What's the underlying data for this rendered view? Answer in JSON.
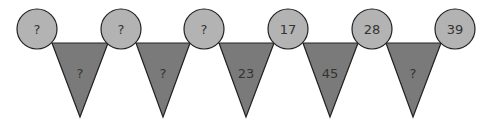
{
  "puzzle": {
    "circle_fill": "#b3b3b3",
    "triangle_fill": "#7a7a7a",
    "stroke": "#222222",
    "circles": [
      {
        "label": "?",
        "cx": 37
      },
      {
        "label": "?",
        "cx": 121
      },
      {
        "label": "?",
        "cx": 204
      },
      {
        "label": "17",
        "cx": 288
      },
      {
        "label": "28",
        "cx": 372
      },
      {
        "label": "39",
        "cx": 455
      }
    ],
    "triangles": [
      {
        "label": "?"
      },
      {
        "label": "?"
      },
      {
        "label": "23"
      },
      {
        "label": "45"
      },
      {
        "label": "?"
      }
    ]
  }
}
